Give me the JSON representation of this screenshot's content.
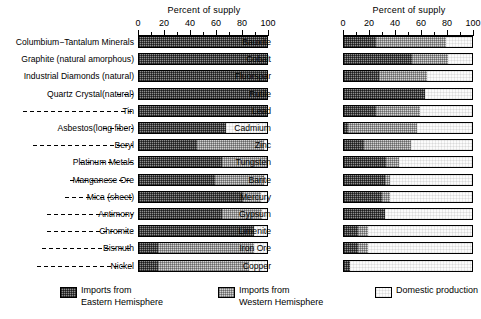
{
  "chart_data": {
    "type": "bar",
    "orientation": "horizontal-stacked",
    "title": "",
    "xlabel": "Percent of supply",
    "ylabel": "",
    "xlim": [
      0,
      100
    ],
    "xticks": [
      0,
      20,
      40,
      60,
      80,
      100
    ],
    "xtick_labels": [
      "0",
      "20",
      "40",
      "60",
      "80",
      "100"
    ],
    "minor_ticks": [
      10,
      30,
      50,
      70,
      90
    ],
    "grid": false,
    "legend_position": "bottom",
    "series": [
      {
        "name": "Imports from Eastern Hemisphere",
        "key": "east",
        "color": "#8e8e8e"
      },
      {
        "name": "Imports from Western Hemisphere",
        "key": "west",
        "color": "#d3d3d3"
      },
      {
        "name": "Domestic production",
        "key": "dom",
        "color": "#fbfbfb"
      }
    ],
    "panels": [
      {
        "panel_id": "left",
        "axis_title": "Percent of supply",
        "categories": [
          "Columbium−Tantalum Minerals",
          "Graphite (natural amorphous)",
          "Industrial Diamonds (natural)",
          "Quartz Crystal(natural)",
          "Tin",
          "Asbestos(long fiber)",
          "Beryl",
          "Platinum Metals",
          "Manganese Ore",
          "Mica (sheet)",
          "Antimony",
          "Chromite",
          "Bismuth",
          "Nickel"
        ],
        "rows": [
          {
            "label": "Columbium−Tantalum Minerals",
            "leader": false,
            "east": 100,
            "west": 0,
            "dom": 0
          },
          {
            "label": "Graphite (natural amorphous)",
            "leader": false,
            "east": 100,
            "west": 0,
            "dom": 0
          },
          {
            "label": "Industrial Diamonds (natural)",
            "leader": false,
            "east": 100,
            "west": 0,
            "dom": 0
          },
          {
            "label": "Quartz Crystal(natural)",
            "leader": true,
            "east": 100,
            "west": 0,
            "dom": 0
          },
          {
            "label": "Tin",
            "leader": true,
            "east": 100,
            "west": 0,
            "dom": 0
          },
          {
            "label": "Asbestos(long fiber)",
            "leader": true,
            "east": 68,
            "west": 0,
            "dom": 32
          },
          {
            "label": "Beryl",
            "leader": true,
            "east": 45,
            "west": 53,
            "dom": 2
          },
          {
            "label": "Platinum Metals",
            "leader": true,
            "east": 65,
            "west": 35,
            "dom": 0
          },
          {
            "label": "Manganese Ore",
            "leader": true,
            "east": 59,
            "west": 39,
            "dom": 2
          },
          {
            "label": "Mica (sheet)",
            "leader": true,
            "east": 81,
            "west": 14,
            "dom": 5
          },
          {
            "label": "Antimony",
            "leader": true,
            "east": 65,
            "west": 31,
            "dom": 4
          },
          {
            "label": "Chromite",
            "leader": true,
            "east": 90,
            "west": 0,
            "dom": 10
          },
          {
            "label": "Bismuth",
            "leader": true,
            "east": 15,
            "west": 75,
            "dom": 10
          },
          {
            "label": "Nickel",
            "leader": true,
            "east": 15,
            "west": 71,
            "dom": 14
          }
        ]
      },
      {
        "panel_id": "right",
        "axis_title": "Percent of supply",
        "categories": [
          "Bauxite",
          "Cobalt",
          "Fluorspar",
          "Rutile",
          "Lead",
          "Cadmium",
          "Zinc",
          "Tungsten",
          "Barite",
          "Mercury",
          "Gypsum",
          "Limenite",
          "Iron Ore",
          "Copper"
        ],
        "rows": [
          {
            "label": "Bauxite",
            "leader": false,
            "east": 25,
            "west": 55,
            "dom": 20
          },
          {
            "label": "Cobalt",
            "leader": false,
            "east": 53,
            "west": 28,
            "dom": 19
          },
          {
            "label": "Fluorspar",
            "leader": false,
            "east": 27,
            "west": 38,
            "dom": 35
          },
          {
            "label": "Rutile",
            "leader": false,
            "east": 63,
            "west": 0,
            "dom": 37
          },
          {
            "label": "Lead",
            "leader": false,
            "east": 25,
            "west": 34,
            "dom": 41
          },
          {
            "label": "Cadmium",
            "leader": false,
            "east": 3,
            "west": 54,
            "dom": 43
          },
          {
            "label": "Zinc",
            "leader": false,
            "east": 16,
            "west": 36,
            "dom": 48
          },
          {
            "label": "Tungsten",
            "leader": false,
            "east": 33,
            "west": 10,
            "dom": 57
          },
          {
            "label": "Barite",
            "leader": false,
            "east": 32,
            "west": 4,
            "dom": 64
          },
          {
            "label": "Mercury",
            "leader": false,
            "east": 30,
            "west": 6,
            "dom": 64
          },
          {
            "label": "Gypsum",
            "leader": false,
            "east": 32,
            "west": 0,
            "dom": 68
          },
          {
            "label": "Limenite",
            "leader": false,
            "east": 11,
            "west": 8,
            "dom": 81
          },
          {
            "label": "Iron Ore",
            "leader": false,
            "east": 11,
            "west": 8,
            "dom": 81
          },
          {
            "label": "Copper",
            "leader": false,
            "east": 5,
            "west": 0,
            "dom": 95
          }
        ]
      }
    ]
  },
  "legend": {
    "items": [
      {
        "line1": "Imports from",
        "line2": "Eastern Hemisphere",
        "swatch": "east"
      },
      {
        "line1": "Imports from",
        "line2": "Western Hemisphere",
        "swatch": "west"
      },
      {
        "line1": "Domestic production",
        "line2": "",
        "swatch": "dom"
      }
    ]
  }
}
